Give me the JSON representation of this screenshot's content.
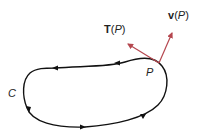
{
  "diagram": {
    "curve_label": "C",
    "point_label": "P",
    "tangent_label": {
      "vector": "T",
      "open": "(",
      "arg": "P",
      "close": ")"
    },
    "velocity_label": {
      "vector": "v",
      "open": "(",
      "arg": "P",
      "close": ")"
    },
    "colors": {
      "curve": "#111111",
      "vectors": "#b5474f",
      "text": "#222222"
    }
  }
}
